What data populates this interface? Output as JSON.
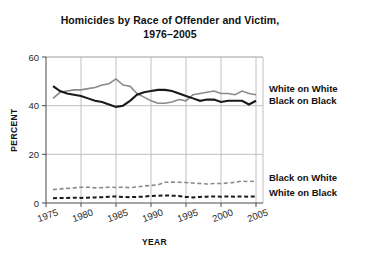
{
  "chart_data": {
    "type": "line",
    "title_line1": "Homicides by Race of Offender and Victim,",
    "title_line2": "1976–2005",
    "xlabel": "YEAR",
    "ylabel": "PERCENT",
    "xlim": [
      1975,
      2006
    ],
    "ylim": [
      0,
      60
    ],
    "yticks": [
      0,
      20,
      40,
      60
    ],
    "ytick_labels": [
      "0",
      "20",
      "40",
      "60"
    ],
    "xticks": [
      1975,
      1980,
      1985,
      1990,
      1995,
      2000,
      2005
    ],
    "xtick_labels": [
      "1975",
      "1980",
      "1985",
      "1990",
      "1995",
      "2000",
      "2005"
    ],
    "grid": true,
    "grid_axis": "both",
    "legend_position": "right-inline-labels",
    "x": [
      1976,
      1977,
      1978,
      1979,
      1980,
      1981,
      1982,
      1983,
      1984,
      1985,
      1986,
      1987,
      1988,
      1989,
      1990,
      1991,
      1992,
      1993,
      1994,
      1995,
      1996,
      1997,
      1998,
      1999,
      2000,
      2001,
      2002,
      2003,
      2004,
      2005
    ],
    "series": [
      {
        "name": "White on White",
        "label": "White on White",
        "color": "#8a8a8a",
        "style": "solid",
        "width": 1.6,
        "values": [
          43.0,
          45.5,
          46.0,
          46.5,
          46.5,
          47.0,
          47.5,
          48.5,
          49.0,
          51.0,
          48.5,
          48.0,
          45.0,
          43.5,
          42.0,
          41.0,
          41.0,
          41.5,
          42.5,
          42.0,
          44.5,
          45.0,
          45.5,
          46.0,
          45.0,
          45.0,
          44.5,
          46.0,
          45.0,
          44.5
        ]
      },
      {
        "name": "Black on Black",
        "label": "Black on Black",
        "color": "#1a1a1a",
        "style": "solid",
        "width": 2.1,
        "values": [
          48.0,
          46.0,
          45.0,
          44.5,
          44.0,
          43.0,
          42.0,
          41.5,
          40.5,
          39.5,
          40.0,
          42.0,
          44.5,
          45.5,
          46.0,
          46.5,
          46.5,
          46.0,
          45.0,
          44.0,
          43.0,
          42.0,
          42.5,
          42.5,
          41.5,
          42.0,
          42.0,
          42.0,
          40.5,
          42.0
        ]
      },
      {
        "name": "Black on White",
        "label": "Black on White",
        "color": "#8a8a8a",
        "style": "dashed",
        "width": 1.6,
        "values": [
          5.5,
          5.8,
          6.0,
          6.2,
          6.5,
          6.5,
          6.2,
          6.3,
          6.5,
          6.4,
          6.5,
          6.3,
          6.6,
          7.0,
          7.2,
          7.5,
          8.5,
          8.6,
          8.5,
          8.4,
          8.2,
          8.0,
          7.8,
          8.0,
          8.0,
          8.2,
          8.5,
          9.0,
          8.8,
          9.0
        ]
      },
      {
        "name": "White on Black",
        "label": "White on Black",
        "color": "#1a1a1a",
        "style": "dashed",
        "width": 2.0,
        "values": [
          2.0,
          2.1,
          2.1,
          2.2,
          2.1,
          2.2,
          2.3,
          2.4,
          2.6,
          2.7,
          2.5,
          2.4,
          2.5,
          2.6,
          2.9,
          3.0,
          3.1,
          3.0,
          2.9,
          2.5,
          2.3,
          2.5,
          2.6,
          2.7,
          2.6,
          2.7,
          2.6,
          2.7,
          2.6,
          2.7
        ]
      }
    ],
    "series_labels_right": [
      {
        "label": "White on White",
        "y_value": 47.0
      },
      {
        "label": "Black on Black",
        "y_value": 42.0
      },
      {
        "label": "Black on White",
        "y_value": 10.5
      },
      {
        "label": "White on Black",
        "y_value": 4.5
      }
    ]
  }
}
